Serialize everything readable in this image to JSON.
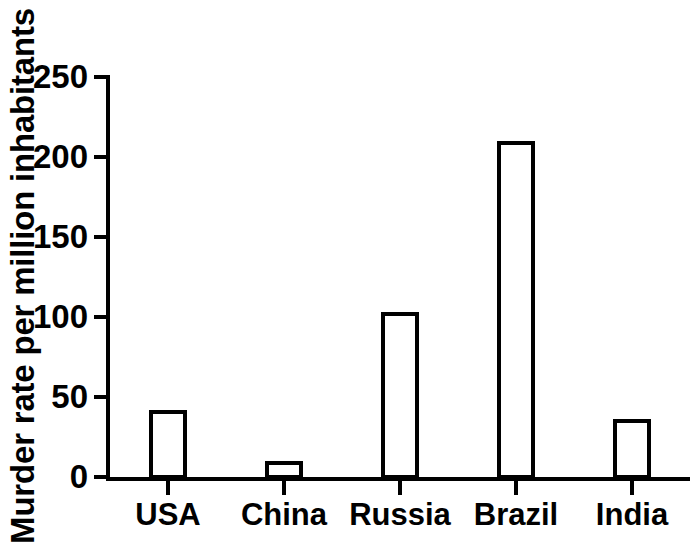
{
  "chart_data": {
    "type": "bar",
    "title": "",
    "subtitle": "",
    "xlabel": "",
    "ylabel": "Murder rate per million inhabitants",
    "categories": [
      "USA",
      "China",
      "Russia",
      "Brazil",
      "India"
    ],
    "values": [
      42,
      10,
      103,
      210,
      36
    ],
    "ylim": [
      0,
      250
    ],
    "ytick_labels": [
      "0",
      "50",
      "100",
      "150",
      "200",
      "250"
    ],
    "ytick_values": [
      0,
      50,
      100,
      150,
      200,
      250
    ],
    "grid": false,
    "legend": false,
    "legend_position": "none",
    "bar_fill_color": "#ffffff",
    "bar_edge_color": "#000000",
    "axis_color": "#000000",
    "background_color": "#ffffff",
    "annotations": []
  }
}
